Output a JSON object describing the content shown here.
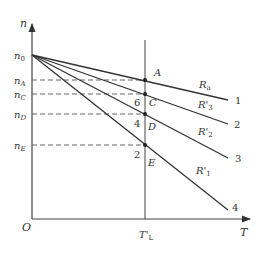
{
  "axes": {
    "y_label": "n",
    "x_label": "T",
    "origin_label": "O",
    "x_marker_label": "T'",
    "x_marker_sub": "L"
  },
  "y_levels": [
    {
      "label": "n",
      "sub": "0"
    },
    {
      "label": "n",
      "sub": "A"
    },
    {
      "label": "n",
      "sub": "C"
    },
    {
      "label": "n",
      "sub": "D"
    },
    {
      "label": "n",
      "sub": "E"
    }
  ],
  "points": [
    {
      "label": "A"
    },
    {
      "label": "C"
    },
    {
      "label": "D"
    },
    {
      "label": "E"
    }
  ],
  "curves": [
    {
      "id": "1",
      "resistance": "R",
      "res_sub": "a",
      "prime": ""
    },
    {
      "id": "2",
      "resistance": "R'",
      "res_sub": "3",
      "prime": "'"
    },
    {
      "id": "3",
      "resistance": "R'",
      "res_sub": "2",
      "prime": "'"
    },
    {
      "id": "4",
      "resistance": "R'",
      "res_sub": "1",
      "prime": "'"
    }
  ],
  "segment_labels": [
    "6",
    "4",
    "2"
  ],
  "colors": {
    "line": "#333333",
    "dash": "#555555"
  }
}
